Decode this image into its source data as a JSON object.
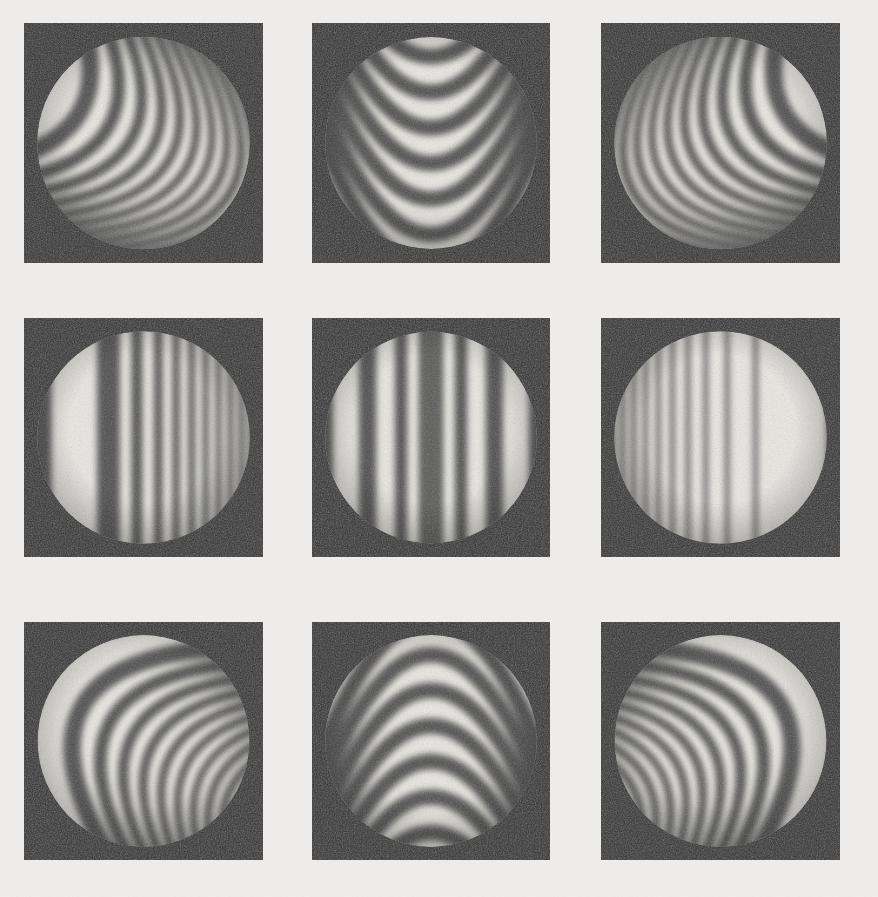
{
  "figure": {
    "kind": "interferogram-plate",
    "rows": 3,
    "columns": 3,
    "page_background_color": "#efeeec",
    "square_background_color": "#2c2c2c",
    "fringe_dark_color": "#4a4a4a",
    "fringe_light_color": "#eceae4",
    "aperture_shape": "circle",
    "grain": true
  },
  "layout": {
    "width": 878,
    "height": 897,
    "squares": [
      {
        "x": 24,
        "y": 23,
        "w": 239,
        "h": 240
      },
      {
        "x": 312,
        "y": 23,
        "w": 238,
        "h": 240
      },
      {
        "x": 601,
        "y": 23,
        "w": 239,
        "h": 240
      },
      {
        "x": 24,
        "y": 318,
        "w": 239,
        "h": 239
      },
      {
        "x": 312,
        "y": 318,
        "w": 238,
        "h": 239
      },
      {
        "x": 601,
        "y": 318,
        "w": 239,
        "h": 239
      },
      {
        "x": 24,
        "y": 622,
        "w": 239,
        "h": 238
      },
      {
        "x": 312,
        "y": 622,
        "w": 238,
        "h": 238
      },
      {
        "x": 601,
        "y": 622,
        "w": 239,
        "h": 238
      }
    ],
    "circle_inset_fraction": 0.055
  },
  "panels": [
    {
      "id": "panel-r1c1",
      "row": 1,
      "column": 1,
      "position_label": "top-left",
      "pattern_type": "curved-fringes",
      "fringe_family": "hyperbolic",
      "orientation_deg": -62,
      "curvature": 0.62,
      "curve_sign": -1,
      "fringe_count": 13,
      "spacing_profile": "converging-right",
      "spacing_min_px": 9,
      "spacing_max_px": 34,
      "vertex_side": "left",
      "notes": "Arcs open toward upper-left; tight straight fringes along right limb"
    },
    {
      "id": "panel-r1c2",
      "row": 1,
      "column": 2,
      "position_label": "top-center",
      "pattern_type": "curved-fringes",
      "fringe_family": "parabolic",
      "orientation_deg": 0,
      "curvature": 1.0,
      "curve_sign": -1,
      "fringe_count": 8,
      "spacing_profile": "uniform",
      "spacing_min_px": 24,
      "spacing_max_px": 30,
      "vertex_side": "center",
      "notes": "Symmetric V / catenary fringes opening upward, apex below center"
    },
    {
      "id": "panel-r1c3",
      "row": 1,
      "column": 3,
      "position_label": "top-right",
      "pattern_type": "curved-fringes",
      "fringe_family": "hyperbolic",
      "orientation_deg": 62,
      "curvature": 0.62,
      "curve_sign": -1,
      "fringe_count": 13,
      "spacing_profile": "converging-left",
      "spacing_min_px": 9,
      "spacing_max_px": 34,
      "vertex_side": "right",
      "notes": "Mirror of top-left; tight straight fringes along left limb"
    },
    {
      "id": "panel-r2c1",
      "row": 2,
      "column": 1,
      "position_label": "middle-left",
      "pattern_type": "straight-fringes",
      "fringe_family": "vertical",
      "orientation_deg": 0,
      "curvature": 0.0,
      "curve_sign": 0,
      "fringe_count": 11,
      "spacing_profile": "chirp-converging-right",
      "spacing_min_px": 8,
      "spacing_max_px": 70,
      "vertex_side": "left",
      "notes": "Broad dark band left of center, fringes crowd toward right edge"
    },
    {
      "id": "panel-r2c2",
      "row": 2,
      "column": 2,
      "position_label": "middle-center",
      "pattern_type": "straight-fringes",
      "fringe_family": "vertical",
      "orientation_deg": 0,
      "curvature": 0.0,
      "curve_sign": 0,
      "fringe_count": 9,
      "spacing_profile": "chirp-symmetric",
      "spacing_min_px": 14,
      "spacing_max_px": 80,
      "vertex_side": "center",
      "notes": "Wide bright band at center; fringes tighten symmetrically toward both limbs"
    },
    {
      "id": "panel-r2c3",
      "row": 2,
      "column": 3,
      "position_label": "middle-right",
      "pattern_type": "straight-fringes",
      "fringe_family": "vertical",
      "orientation_deg": 0,
      "curvature": 0.0,
      "curve_sign": 0,
      "fringe_count": 11,
      "spacing_profile": "chirp-converging-left",
      "spacing_min_px": 8,
      "spacing_max_px": 70,
      "vertex_side": "right",
      "notes": "Mirror of middle-left; fringes crowd toward left edge"
    },
    {
      "id": "panel-r3c1",
      "row": 3,
      "column": 1,
      "position_label": "bottom-left",
      "pattern_type": "curved-fringes",
      "fringe_family": "hyperbolic",
      "orientation_deg": -62,
      "curvature": 0.62,
      "curve_sign": 1,
      "fringe_count": 13,
      "spacing_profile": "converging-right",
      "spacing_min_px": 9,
      "spacing_max_px": 34,
      "vertex_side": "left",
      "notes": "Vertical mirror of top-left; arcs open toward lower-left"
    },
    {
      "id": "panel-r3c2",
      "row": 3,
      "column": 2,
      "position_label": "bottom-center",
      "pattern_type": "curved-fringes",
      "fringe_family": "parabolic",
      "orientation_deg": 0,
      "curvature": 1.0,
      "curve_sign": 1,
      "fringe_count": 8,
      "spacing_profile": "uniform",
      "spacing_min_px": 24,
      "spacing_max_px": 30,
      "vertex_side": "center",
      "notes": "Symmetric inverted-U arches, apex above center"
    },
    {
      "id": "panel-r3c3",
      "row": 3,
      "column": 3,
      "position_label": "bottom-right",
      "pattern_type": "curved-fringes",
      "fringe_family": "hyperbolic",
      "orientation_deg": 62,
      "curvature": 0.62,
      "curve_sign": 1,
      "fringe_count": 13,
      "spacing_profile": "converging-left",
      "spacing_min_px": 9,
      "spacing_max_px": 34,
      "vertex_side": "right",
      "notes": "Mirror of bottom-left; arcs open toward lower-right"
    }
  ]
}
